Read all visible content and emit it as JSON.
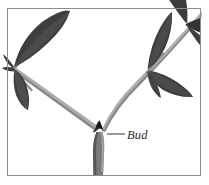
{
  "figure": {
    "kind": "botanical-illustration",
    "background_color": "#ffffff",
    "frame": {
      "border_color": "#8c8c8c",
      "border_width_px": 1,
      "inset_left_px": 7,
      "inset_top_px": 8,
      "inset_right_px": 8,
      "inset_bottom_px": 9
    },
    "annotation": {
      "label": "Bud",
      "label_style": "italic-serif",
      "label_color": "#2b2b2b",
      "leader_line_color": "#4a4a4a",
      "leader_from": {
        "x": 107,
        "y": 134
      },
      "leader_to": {
        "x": 125,
        "y": 134
      }
    },
    "palette": {
      "leaf_dark": "#3a3a3a",
      "leaf_mid": "#4e4e4e",
      "leaf_light": "#606060",
      "stem_gray": "#7d7d7d",
      "stem_shadow": "#5a5a5a",
      "stem_highlight": "#a8a8a8",
      "bud_black": "#1d1d1d"
    },
    "structure": {
      "main_stem": {
        "from": {
          "x": 97,
          "y": 176
        },
        "to": {
          "x": 99,
          "y": 131
        }
      },
      "fork_point": {
        "x": 99,
        "y": 131
      },
      "left_branch_to": {
        "x": 8,
        "y": 68
      },
      "right_branch_to": {
        "x": 201,
        "y": 14
      },
      "nodes": [
        {
          "name": "left-node",
          "x": 14,
          "y": 68
        },
        {
          "name": "right-node",
          "x": 148,
          "y": 70
        },
        {
          "name": "upper-right-node",
          "x": 186,
          "y": 23
        }
      ],
      "leaf_count": 9
    }
  }
}
